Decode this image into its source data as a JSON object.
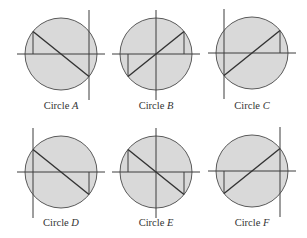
{
  "figure": {
    "radius": 36,
    "fill_color": "#d9d9d9",
    "circles": [
      {
        "label_prefix": "Circle",
        "letter": "A",
        "cx": 61,
        "cy": 54,
        "axis_x": 28,
        "diagonal": "down",
        "drops": [
          "start"
        ]
      },
      {
        "label_prefix": "Circle",
        "letter": "B",
        "cx": 156,
        "cy": 54,
        "axis_x": 0,
        "diagonal": "up",
        "drops": [
          "start",
          "end"
        ]
      },
      {
        "label_prefix": "Circle",
        "letter": "C",
        "cx": 252,
        "cy": 53,
        "axis_x": -28,
        "diagonal": "up",
        "drops": [
          "end"
        ]
      },
      {
        "label_prefix": "Circle",
        "letter": "D",
        "cx": 61,
        "cy": 172,
        "axis_x": -28,
        "diagonal": "down",
        "drops": [
          "end"
        ]
      },
      {
        "label_prefix": "Circle",
        "letter": "E",
        "cx": 156,
        "cy": 172,
        "axis_x": 0,
        "diagonal": "down",
        "drops": [
          "start",
          "end"
        ]
      },
      {
        "label_prefix": "Circle",
        "letter": "F",
        "cx": 252,
        "cy": 171,
        "axis_x": 28,
        "diagonal": "up",
        "drops": [
          "start"
        ]
      }
    ],
    "labels_y": [
      109,
      226
    ]
  }
}
